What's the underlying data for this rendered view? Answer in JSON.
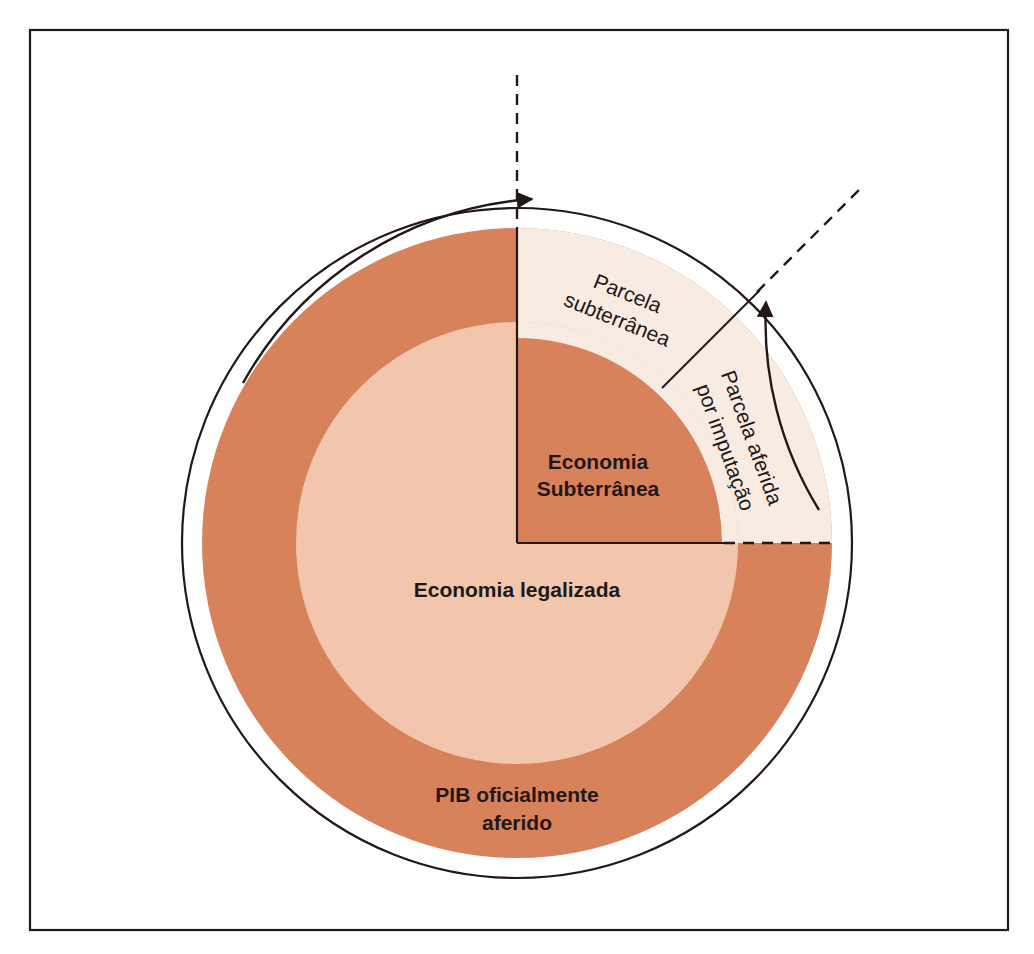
{
  "figure": {
    "type": "concentric-circles-diagram",
    "language": "pt-BR",
    "frame": {
      "name": "figure-border"
    },
    "colors": {
      "outer_ring": "#D8825C",
      "middle_ring": "#F2C6AC",
      "inner_quadrant": "#D8825C",
      "wedge_pale": "#F7EBE2",
      "stroke": "#231815",
      "background": "#FFFFFF"
    },
    "labels": {
      "outer_ring": "PIB oficialmente\naferido",
      "outer_ring_line1": "PIB oficialmente",
      "outer_ring_line2": "aferido",
      "middle_ring": "Economia legalizada",
      "inner_quadrant_line1": "Economia",
      "inner_quadrant_line2": "Subterrânea",
      "wedge_left_line1": "Parcela",
      "wedge_left_line2": "subterrânea",
      "wedge_right_line1": "Parcela aferida",
      "wedge_right_line2": "por imputação"
    },
    "annotations": {
      "arrow_left": {
        "name": "arrow-to-parcela-subterranea",
        "direction": "counter-clockwise-to-vertical-axis"
      },
      "arrow_right": {
        "name": "arrow-to-parcela-aferida",
        "direction": "counter-clockwise-to-diagonal-axis"
      },
      "dashed_vertical": {
        "name": "dashed-vertical-axis",
        "angle_deg": 90
      },
      "dashed_diagonal": {
        "name": "dashed-diagonal-axis",
        "angle_deg": 45
      },
      "dashed_horizontal": {
        "name": "dashed-horizontal-segment",
        "angle_deg": 0
      }
    },
    "geometry": {
      "center_x": 517,
      "center_y": 543,
      "r_thin_circle": 335,
      "r_outer_disk": 315,
      "r_middle": 221,
      "r_inner_quadrant": 205
    }
  }
}
